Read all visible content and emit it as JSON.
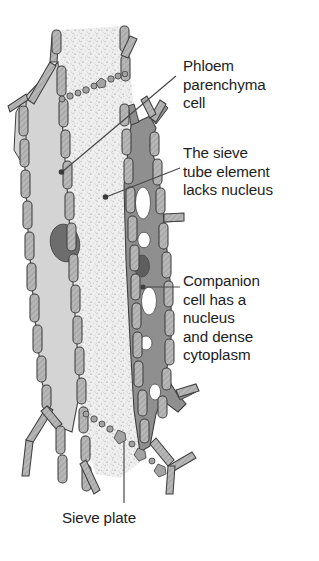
{
  "figure": {
    "subject": "phloem",
    "labels": {
      "phloem_parenchyma": "Phloem\nparenchyma\ncell",
      "sieve_tube": "The sieve\ntube element\nlacks nucleus",
      "companion": "Companion\ncell has a\nnucleus\nand dense\ncytoplasm",
      "sieve_plate": "Sieve plate"
    },
    "structures": [
      {
        "name": "phloem-parenchyma-cell",
        "label": "Phloem parenchyma cell",
        "fill": "#d3d3d3"
      },
      {
        "name": "sieve-tube-element",
        "label": "The sieve tube element lacks nucleus",
        "fill": "#ededed"
      },
      {
        "name": "companion-cell",
        "label": "Companion cell has a nucleus and dense cytoplasm",
        "fill": "#8f8f8f"
      },
      {
        "name": "sieve-plate",
        "label": "Sieve plate",
        "fill": "#9a9a9a"
      },
      {
        "name": "parenchyma-nucleus",
        "label": "Nucleus",
        "fill": "#707070"
      },
      {
        "name": "companion-nucleus",
        "label": "Nucleus",
        "fill": "#5e5e5e"
      },
      {
        "name": "companion-vacuole",
        "label": "Vacuole",
        "fill": "#ffffff"
      },
      {
        "name": "cell-wall",
        "label": "Cell wall",
        "fill": "#b5b5b5"
      }
    ],
    "colors": {
      "outline": "#3a3a3a",
      "cell_wall": "#b5b5b5",
      "parenchyma_cytoplasm": "#d3d3d3",
      "sieve_lumen": "#ededed",
      "companion_cytoplasm": "#8f8f8f",
      "nucleus": "#6b6b6b",
      "vacuole": "#ffffff",
      "leader_line": "#4a4a4a",
      "text": "#1d1d1d",
      "background": "#ffffff"
    }
  }
}
